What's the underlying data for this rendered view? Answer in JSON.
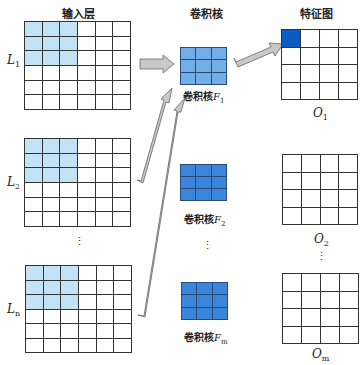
{
  "headers": {
    "input_layer": "输入层",
    "kernel": "卷积核",
    "feature_map": "特征图"
  },
  "input_layers": [
    {
      "label": "L",
      "sub": "1",
      "rows": 6,
      "cols": 6,
      "highlight_rows": 3,
      "highlight_cols": 3
    },
    {
      "label": "L",
      "sub": "2",
      "rows": 6,
      "cols": 6,
      "highlight_rows": 3,
      "highlight_cols": 3
    },
    {
      "label": "L",
      "sub": "n",
      "rows": 6,
      "cols": 6,
      "highlight_rows": 3,
      "highlight_cols": 3
    }
  ],
  "kernels": [
    {
      "prefix": "卷积核",
      "label": "F",
      "sub": "1",
      "rows": 3,
      "cols": 3,
      "color": "#72aee8"
    },
    {
      "prefix": "卷积核",
      "label": "F",
      "sub": "2",
      "rows": 3,
      "cols": 3,
      "color": "#3b86dc"
    },
    {
      "prefix": "卷积核",
      "label": "F",
      "sub": "m",
      "rows": 3,
      "cols": 3,
      "color": "#3b86dc"
    }
  ],
  "outputs": [
    {
      "label": "O",
      "sub": "1",
      "rows": 4,
      "cols": 4,
      "filled_cell": [
        0,
        0
      ],
      "fill_color": "#0b5cc4"
    },
    {
      "label": "O",
      "sub": "2",
      "rows": 4,
      "cols": 4
    },
    {
      "label": "O",
      "sub": "m",
      "rows": 4,
      "cols": 4
    }
  ],
  "ellipsis": "⋮",
  "colors": {
    "highlight": "#c2e3f5",
    "arrow_fill": "#c8c8c8",
    "arrow_stroke": "#666666",
    "grid_line": "#333333"
  }
}
